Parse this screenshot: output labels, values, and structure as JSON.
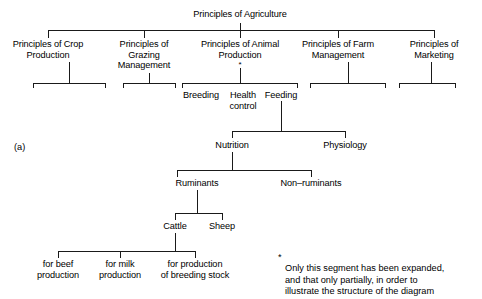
{
  "figure": {
    "panel_label": "(a)",
    "title": "Principles of Agriculture",
    "footnote": "Only this segment has been expanded,\nand that only partially, in order to\nillustrate the structure of the diagram",
    "footnote_marker": "*",
    "expanded_marker": "*",
    "line_color": "#1a1a1a",
    "text_color": "#000000",
    "background": "#ffffff"
  },
  "tree": {
    "root": "Principles of Agriculture",
    "level1": [
      {
        "label": "Principles of Crop\nProduction",
        "has_children": true
      },
      {
        "label": "Principles of\nGrazing\nManagement",
        "has_children": true
      },
      {
        "label": "Principles of Animal\nProduction",
        "has_children": true,
        "marked": true
      },
      {
        "label": "Principles of Farm\nManagement",
        "has_children": true
      },
      {
        "label": "Principles of\nMarketing",
        "has_children": true
      }
    ],
    "animal_production_children": [
      "Breeding",
      "Health\ncontrol",
      "Feeding"
    ],
    "feeding_children": [
      "Nutrition",
      "Physiology"
    ],
    "nutrition_children": [
      "Ruminants",
      "Non–ruminants"
    ],
    "ruminants_children": [
      "Cattle",
      "Sheep"
    ],
    "cattle_children": [
      "for beef\nproduction",
      "for milk\nproduction",
      "for production\nof breeding stock"
    ]
  }
}
